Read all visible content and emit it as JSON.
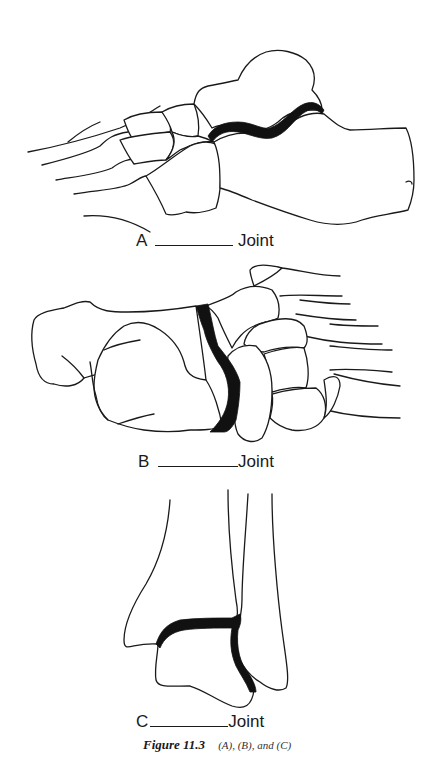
{
  "figure": {
    "panels": [
      {
        "id": "A",
        "letter": "A",
        "suffix": "Joint",
        "view": "lateral foot",
        "highlighted": "subtalar"
      },
      {
        "id": "B",
        "letter": "B",
        "suffix": "Joint",
        "view": "medial foot",
        "highlighted": "transverse tarsal"
      },
      {
        "id": "C",
        "letter": "C",
        "suffix": "Joint",
        "view": "posterior ankle",
        "highlighted": "talocrural"
      }
    ],
    "caption": {
      "number": "Figure 11.3",
      "description": "(A), (B), and (C)"
    },
    "colors": {
      "line": "#1a1a1a",
      "joint_fill": "#111111",
      "background": "#ffffff"
    }
  }
}
